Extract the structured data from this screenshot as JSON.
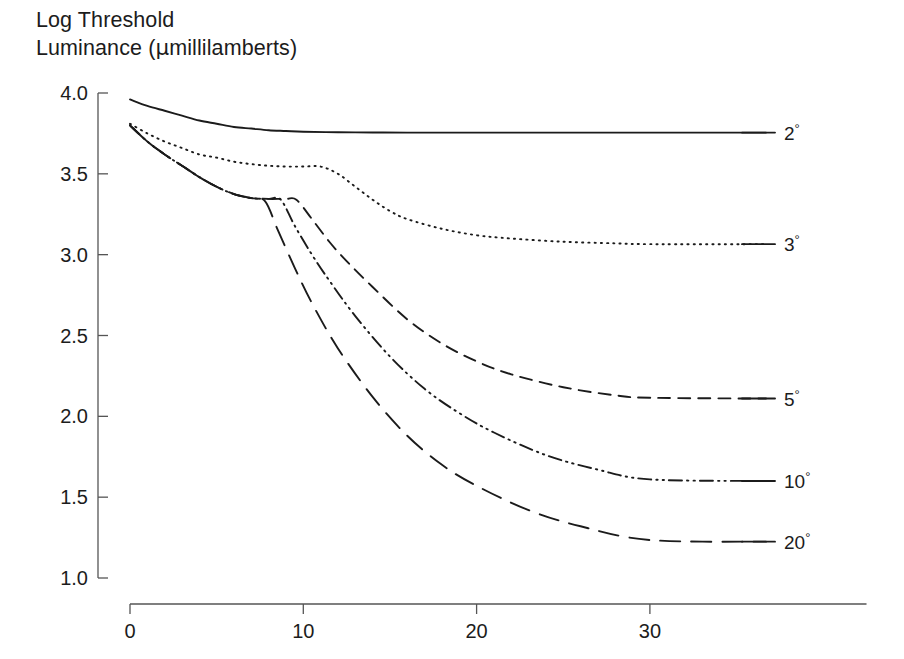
{
  "figure": {
    "title_line1": "Log Threshold",
    "title_line2_pre": "Luminance (",
    "title_line2_mu": "μ",
    "title_line2_post": "millilamberts)"
  },
  "chart_data": {
    "type": "line",
    "xlabel": "",
    "ylabel": "Log Threshold Luminance (μmillilamberts)",
    "xlim": [
      0,
      42.5
    ],
    "ylim": [
      1.0,
      4.0
    ],
    "grid": false,
    "legend_position": "right-of-curve-ends",
    "x_ticks": [
      0,
      10,
      20,
      30
    ],
    "x_tick_labels": [
      "0",
      "10",
      "20",
      "30"
    ],
    "y_ticks": [
      1.0,
      1.5,
      2.0,
      2.5,
      3.0,
      3.5,
      4.0
    ],
    "y_tick_labels": [
      "1.0",
      "1.5",
      "2.0",
      "2.5",
      "3.0",
      "3.5",
      "4.0"
    ],
    "series": [
      {
        "name": "2°",
        "legend_label": "2",
        "legend_unit": "°",
        "style": "solid",
        "x": [
          0,
          1,
          2,
          3,
          4,
          5,
          6,
          7,
          8,
          9,
          10,
          12,
          14,
          16,
          20,
          25,
          30,
          36.7
        ],
        "values": [
          3.96,
          3.92,
          3.89,
          3.86,
          3.83,
          3.81,
          3.79,
          3.78,
          3.77,
          3.765,
          3.76,
          3.757,
          3.756,
          3.755,
          3.755,
          3.755,
          3.755,
          3.755
        ]
      },
      {
        "name": "3°",
        "legend_label": "3",
        "legend_unit": "°",
        "style": "dotted",
        "x": [
          0,
          1,
          2,
          3,
          4,
          5,
          6,
          7,
          8,
          9,
          10,
          11,
          12,
          13,
          14,
          15,
          16,
          18,
          20,
          22,
          25,
          28,
          30,
          36.7
        ],
        "values": [
          3.81,
          3.75,
          3.7,
          3.66,
          3.62,
          3.6,
          3.575,
          3.56,
          3.55,
          3.545,
          3.545,
          3.545,
          3.5,
          3.42,
          3.34,
          3.27,
          3.22,
          3.16,
          3.12,
          3.1,
          3.08,
          3.07,
          3.065,
          3.065
        ]
      },
      {
        "name": "5°",
        "legend_label": "5",
        "legend_unit": "°",
        "style": "dashed",
        "branch_x": 9.6,
        "x": [
          0,
          1,
          2,
          3,
          4,
          5,
          6,
          7,
          8,
          9,
          9.6,
          10.5,
          11.5,
          12.5,
          14,
          16,
          18,
          20,
          22,
          25,
          28,
          30,
          36.7
        ],
        "values": [
          3.8,
          3.7,
          3.62,
          3.55,
          3.48,
          3.42,
          3.375,
          3.35,
          3.345,
          3.345,
          3.34,
          3.22,
          3.08,
          2.96,
          2.8,
          2.6,
          2.45,
          2.34,
          2.26,
          2.18,
          2.13,
          2.115,
          2.11
        ]
      },
      {
        "name": "10°",
        "legend_label": "10",
        "legend_unit": "°",
        "style": "dash-dot-dot",
        "branch_x": 8.7,
        "x": [
          0,
          1,
          2,
          3,
          4,
          5,
          6,
          7,
          8,
          8.7,
          9.5,
          10.5,
          11.5,
          13,
          15,
          17,
          19,
          21,
          24,
          27,
          30,
          36.7
        ],
        "values": [
          3.8,
          3.7,
          3.62,
          3.55,
          3.48,
          3.42,
          3.375,
          3.35,
          3.345,
          3.34,
          3.18,
          3.0,
          2.84,
          2.62,
          2.37,
          2.17,
          2.02,
          1.9,
          1.76,
          1.67,
          1.61,
          1.6
        ]
      },
      {
        "name": "20°",
        "legend_label": "20",
        "legend_unit": "°",
        "style": "long-dash",
        "branch_x": 7.8,
        "x": [
          0,
          1,
          2,
          3,
          4,
          5,
          6,
          7,
          7.8,
          8.5,
          9.5,
          10.5,
          12,
          14,
          16,
          18,
          20,
          23,
          26,
          30,
          36.7
        ],
        "values": [
          3.8,
          3.7,
          3.62,
          3.55,
          3.48,
          3.42,
          3.375,
          3.35,
          3.33,
          3.16,
          2.92,
          2.7,
          2.42,
          2.12,
          1.88,
          1.7,
          1.57,
          1.42,
          1.32,
          1.235,
          1.225
        ]
      }
    ]
  }
}
